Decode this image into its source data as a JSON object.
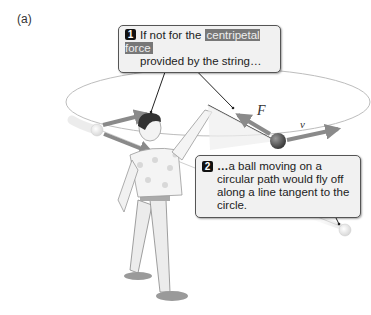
{
  "panel": {
    "label": "(a)"
  },
  "callouts": [
    {
      "number": "1",
      "text_before": "If not for the",
      "highlight": "centripetal force",
      "text_after": "provided by the string…"
    },
    {
      "number": "2",
      "lead": "…",
      "text": "a ball moving on a circular path would fly off along a line tangent to the circle."
    }
  ],
  "labels": {
    "force": "F",
    "velocity": "v"
  },
  "colors": {
    "arrow": "#8a8a8a",
    "ball": "#5a5a5a",
    "orbit": "#bdbdbd",
    "callout_bg": "#f1f1f1",
    "highlight_bg": "#777777"
  }
}
